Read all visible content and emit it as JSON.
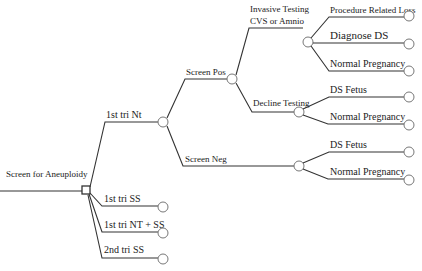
{
  "diagram": {
    "type": "decision-tree",
    "root": {
      "label": "Screen for Aneuploidy",
      "node_type": "decision",
      "branches": [
        {
          "label": "1st tri Nt",
          "node_type": "chance",
          "branches": [
            {
              "label": "Screen Pos",
              "node_type": "chance",
              "branches": [
                {
                  "label": "Invasive Testing\nCVS or Amnio",
                  "label_line1": "Invasive Testing",
                  "label_line2": "CVS or Amnio",
                  "node_type": "chance",
                  "branches": [
                    {
                      "label": "Procedure Related Loss",
                      "node_type": "chance"
                    },
                    {
                      "label": "Diagnose DS",
                      "node_type": "chance"
                    },
                    {
                      "label": "Normal Pregnancy",
                      "node_type": "chance"
                    }
                  ]
                },
                {
                  "label": "Decline Testing",
                  "node_type": "chance",
                  "branches": [
                    {
                      "label": "DS Fetus",
                      "node_type": "chance"
                    },
                    {
                      "label": "Normal Pregnancy",
                      "node_type": "chance"
                    }
                  ]
                }
              ]
            },
            {
              "label": "Screen Neg",
              "node_type": "chance",
              "branches": [
                {
                  "label": "DS Fetus",
                  "node_type": "chance"
                },
                {
                  "label": "Normal Pregnancy",
                  "node_type": "chance"
                }
              ]
            }
          ]
        },
        {
          "label": "1st tri SS",
          "node_type": "chance"
        },
        {
          "label": "1st tri NT + SS",
          "node_type": "chance"
        },
        {
          "label": "2nd tri SS",
          "node_type": "chance"
        }
      ]
    }
  },
  "labels": {
    "root": "Screen for Aneuploidy",
    "nt": "1st tri Nt",
    "ss1": "1st tri SS",
    "ntss": "1st tri NT + SS",
    "ss2": "2nd tri SS",
    "pos": "Screen Pos",
    "neg": "Screen Neg",
    "inv1": "Invasive Testing",
    "inv2": "CVS or Amnio",
    "decline": "Decline Testing",
    "prl": "Procedure Related Loss",
    "dx": "Diagnose DS",
    "np1": "Normal Pregnancy",
    "dsf1": "DS Fetus",
    "np2": "Normal Pregnancy",
    "dsf2": "DS Fetus",
    "np3": "Normal Pregnancy"
  }
}
